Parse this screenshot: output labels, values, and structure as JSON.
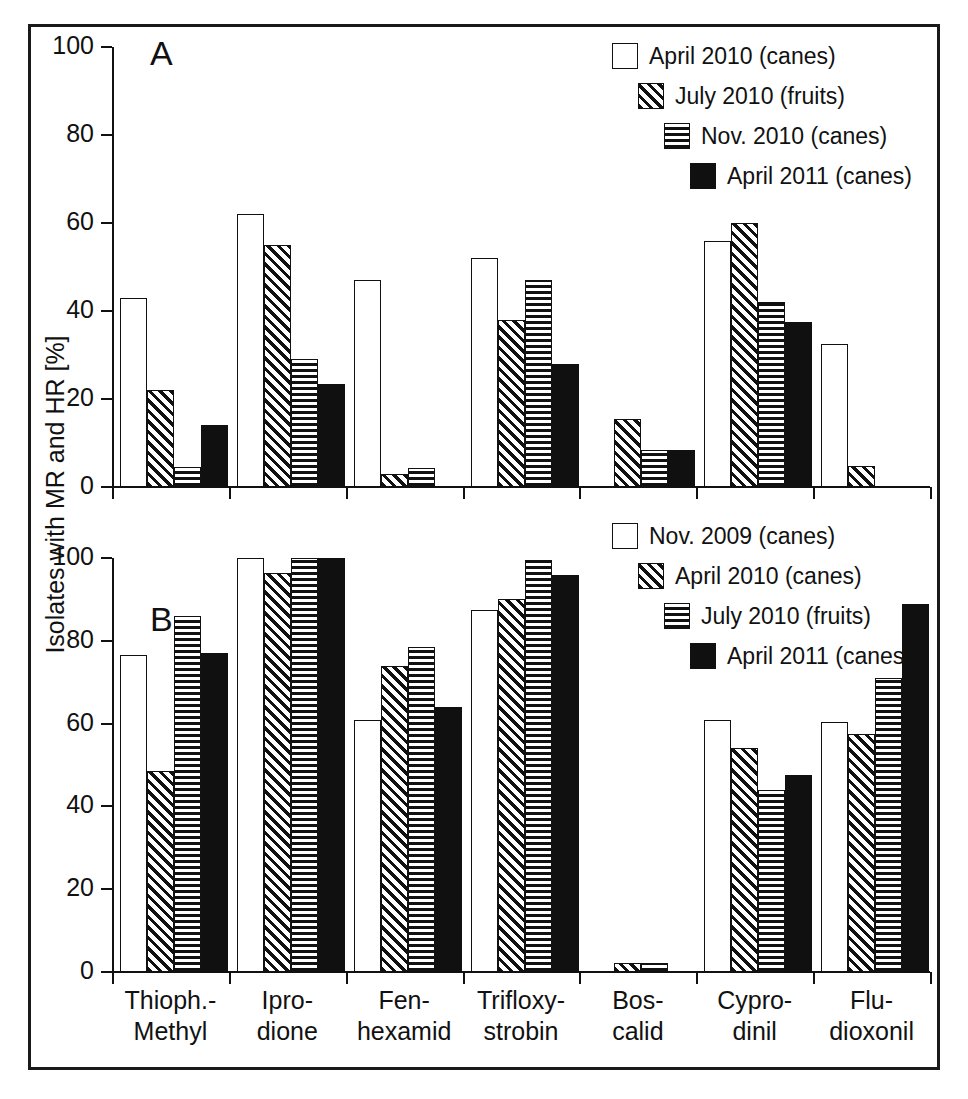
{
  "figure": {
    "ylabel": "Isolates with MR and HR [%]",
    "panel_a_letter": "A",
    "panel_b_letter": "B"
  },
  "axis": {
    "yticks": [
      "0",
      "20",
      "40",
      "60",
      "80",
      "100"
    ],
    "ymin": 0,
    "ymax": 100
  },
  "categories": [
    {
      "line1": "Thioph.-",
      "line2": "Methyl"
    },
    {
      "line1": "Ipro-",
      "line2": "dione"
    },
    {
      "line1": "Fen-",
      "line2": "hexamid"
    },
    {
      "line1": "Trifloxy-",
      "line2": "strobin"
    },
    {
      "line1": "Bos-",
      "line2": "calid"
    },
    {
      "line1": "Cypro-",
      "line2": "dinil"
    },
    {
      "line1": "Flu-",
      "line2": "dioxonil"
    }
  ],
  "legend_a": [
    {
      "label": "April 2010 (canes)",
      "fill": "white"
    },
    {
      "label": "July 2010 (fruits)",
      "fill": "diag"
    },
    {
      "label": "Nov. 2010 (canes)",
      "fill": "horiz"
    },
    {
      "label": "April 2011 (canes)",
      "fill": "black"
    }
  ],
  "legend_b": [
    {
      "label": "Nov. 2009 (canes)",
      "fill": "white"
    },
    {
      "label": "April 2010 (canes)",
      "fill": "diag"
    },
    {
      "label": "July 2010 (fruits)",
      "fill": "horiz"
    },
    {
      "label": "April 2011 (canes)",
      "fill": "black"
    }
  ],
  "chart_data": [
    {
      "type": "bar",
      "panel": "A",
      "title": "A",
      "xlabel": "",
      "ylabel": "Isolates with MR and HR [%]",
      "ylim": [
        0,
        100
      ],
      "yticks": [
        0,
        20,
        40,
        60,
        80,
        100
      ],
      "grid": false,
      "legend_position": "top-right",
      "categories": [
        "Thioph.-Methyl",
        "Iprodione",
        "Fenhexamid",
        "Trifloxystrobin",
        "Boscalid",
        "Cyprodinil",
        "Fludioxonil"
      ],
      "series": [
        {
          "name": "April 2010 (canes)",
          "fill": "white",
          "values": [
            43,
            62,
            47,
            52,
            null,
            56,
            32.5
          ]
        },
        {
          "name": "July 2010 (fruits)",
          "fill": "diag",
          "values": [
            22,
            55,
            3,
            38,
            15.5,
            60,
            4.7
          ]
        },
        {
          "name": "Nov. 2010 (canes)",
          "fill": "horiz",
          "values": [
            4.5,
            29,
            4.3,
            47,
            8.5,
            42,
            null
          ]
        },
        {
          "name": "April 2011 (canes)",
          "fill": "black",
          "values": [
            14,
            23.5,
            null,
            28,
            8.5,
            37.5,
            null
          ]
        }
      ]
    },
    {
      "type": "bar",
      "panel": "B",
      "title": "B",
      "xlabel": "",
      "ylabel": "Isolates with MR and HR [%]",
      "ylim": [
        0,
        100
      ],
      "yticks": [
        0,
        20,
        40,
        60,
        80,
        100
      ],
      "grid": false,
      "legend_position": "top-right",
      "categories": [
        "Thioph.-Methyl",
        "Iprodione",
        "Fenhexamid",
        "Trifloxystrobin",
        "Boscalid",
        "Cyprodinil",
        "Fludioxonil"
      ],
      "series": [
        {
          "name": "Nov. 2009 (canes)",
          "fill": "white",
          "values": [
            76.5,
            100,
            61,
            87.5,
            null,
            61,
            60.5
          ]
        },
        {
          "name": "April 2010 (canes)",
          "fill": "diag",
          "values": [
            48.5,
            96.5,
            74,
            90,
            2.2,
            54,
            57.5
          ]
        },
        {
          "name": "July 2010 (fruits)",
          "fill": "horiz",
          "values": [
            86,
            100,
            78.5,
            99.5,
            2.2,
            44,
            71
          ]
        },
        {
          "name": "April 2011 (canes)",
          "fill": "black",
          "values": [
            77,
            100,
            64,
            96,
            null,
            47.5,
            89
          ]
        }
      ]
    }
  ]
}
